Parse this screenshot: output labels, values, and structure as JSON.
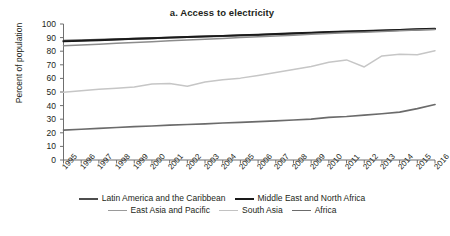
{
  "chart_data": {
    "type": "line",
    "title": "a. Access to electricity",
    "xlabel": "",
    "ylabel": "Percent of population",
    "ylim": [
      0,
      100
    ],
    "ytick_step": 10,
    "yticks": [
      100,
      90,
      80,
      70,
      60,
      50,
      40,
      30,
      20,
      10,
      0
    ],
    "grid": false,
    "legend_position": "bottom",
    "categories": [
      1995,
      1996,
      1997,
      1998,
      1999,
      2000,
      2001,
      2002,
      2003,
      2004,
      2005,
      2006,
      2007,
      2008,
      2009,
      2010,
      2011,
      2012,
      2013,
      2014,
      2015,
      2016
    ],
    "x": [
      "1995",
      "1996",
      "1997",
      "1998",
      "1999",
      "2000",
      "2001",
      "2002",
      "2003",
      "2004",
      "2005",
      "2006",
      "2007",
      "2008",
      "2009",
      "2010",
      "2011",
      "2012",
      "2013",
      "2014",
      "2015",
      "2016"
    ],
    "series": [
      {
        "name": "Latin America and the Caribbean",
        "color": "#4d4d4d",
        "width": 2.0,
        "values": [
          87.6,
          88.0,
          88.4,
          88.8,
          89.2,
          89.6,
          90.0,
          90.4,
          90.8,
          91.2,
          91.6,
          92.0,
          92.4,
          92.9,
          93.4,
          93.9,
          94.3,
          94.7,
          95.1,
          95.5,
          95.9,
          96.4
        ]
      },
      {
        "name": "Middle East and North Africa",
        "color": "#1a1a1a",
        "width": 1.9,
        "values": [
          87.2,
          87.6,
          88.1,
          88.6,
          89.1,
          89.5,
          90.0,
          90.4,
          90.9,
          91.3,
          91.8,
          92.2,
          92.7,
          93.2,
          93.6,
          94.1,
          94.5,
          94.9,
          95.3,
          95.7,
          96.1,
          96.6
        ]
      },
      {
        "name": "East Asia and Pacific",
        "color": "#8c8c8c",
        "width": 1.5,
        "values": [
          84.0,
          84.6,
          85.2,
          85.8,
          86.4,
          87.0,
          87.6,
          88.2,
          88.8,
          89.4,
          90.0,
          90.6,
          91.2,
          91.8,
          92.4,
          93.0,
          93.5,
          94.0,
          94.5,
          95.0,
          95.5,
          96.0
        ]
      },
      {
        "name": "South Asia",
        "color": "#c6c6c6",
        "width": 1.5,
        "values": [
          49.8,
          51.0,
          52.0,
          52.8,
          53.6,
          55.8,
          56.3,
          54.2,
          57.4,
          59.0,
          60.2,
          62.2,
          64.3,
          66.5,
          68.8,
          71.8,
          73.6,
          68.4,
          76.5,
          77.8,
          77.4,
          80.4
        ]
      },
      {
        "name": "Africa",
        "color": "#6b6b6b",
        "width": 1.7,
        "values": [
          22.0,
          22.6,
          23.2,
          23.9,
          24.5,
          25.0,
          25.6,
          26.1,
          26.6,
          27.2,
          27.7,
          28.2,
          28.8,
          29.4,
          30.0,
          31.4,
          32.0,
          33.0,
          34.0,
          35.2,
          37.8,
          40.8
        ]
      }
    ]
  },
  "legend": {
    "rows": [
      [
        {
          "label": "Latin America and the Caribbean",
          "color": "#4d4d4d",
          "width": 2.0
        },
        {
          "label": "Middle East and North Africa",
          "color": "#1a1a1a",
          "width": 2.2
        }
      ],
      [
        {
          "label": "East Asia and Pacific",
          "color": "#9a9a9a",
          "width": 1.5
        },
        {
          "label": "South Asia",
          "color": "#c2c2c2",
          "width": 1.5
        },
        {
          "label": "Africa",
          "color": "#6b6b6b",
          "width": 1.9
        }
      ]
    ]
  },
  "axes": {
    "axis_color": "#6f6f6f"
  }
}
